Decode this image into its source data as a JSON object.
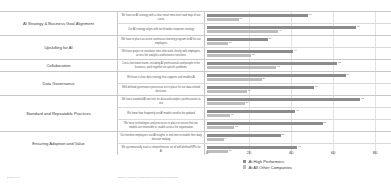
{
  "chart_data": {
    "type": "bar",
    "orientation": "horizontal",
    "title": "",
    "xlabel": "",
    "ylabel": "",
    "xlim": [
      0,
      80
    ],
    "ticks": [
      "0",
      "20",
      "40",
      "60",
      "80"
    ],
    "grid": true,
    "legend_position": "bottom",
    "series": [
      {
        "name": "At High Performers",
        "color": "#8c8c8c"
      },
      {
        "name": "At All Other Companies",
        "color": "#bdbdbd"
      }
    ],
    "categories": [
      {
        "name": "AI Strategy & Business Goal Alignment",
        "statements": [
          {
            "text": "We have an AI strategy with a clear smart time-level road map of use cases",
            "high": 48,
            "other": 15
          },
          {
            "text": "Our AI strategy aligns with our broader corporate strategy",
            "high": 71,
            "other": 34
          }
        ]
      },
      {
        "name": "Upskilling for AI",
        "statements": [
          {
            "text": "We have in place an active continuous learning program for AI for our employees",
            "high": 29,
            "other": 10
          },
          {
            "text": "We have project or translator roles who work closely with employees across the analytics and business functions",
            "high": 41,
            "other": 21
          }
        ]
      },
      {
        "name": "Collaboration",
        "statements": [
          {
            "text": "Cross-functional teams, including AI professionals and people in the business, work together on specific problems",
            "high": 62,
            "other": 33
          }
        ]
      },
      {
        "name": "Data Governance",
        "statements": [
          {
            "text": "We have a clear data strategy that supports and enables AI",
            "high": 66,
            "other": 26
          },
          {
            "text": "Well-defined governance processes are in place for our data-related decisions",
            "high": 51,
            "other": 19
          }
        ]
      },
      {
        "name": "Standard and Repeatable Practices",
        "statements": [
          {
            "text": "We have standard AI tool sets for data and analytics professionals to use",
            "high": 73,
            "other": 18
          },
          {
            "text": "We know how frequently our AI models need to be updated",
            "high": 42,
            "other": 11
          },
          {
            "text": "We have technologies and processes in place to ensure that our models are extensible or usable across the organization",
            "high": 55,
            "other": 13
          }
        ]
      },
      {
        "name": "Ensuring Adoption and Value",
        "statements": [
          {
            "text": "Our frontline employees use AI insights in real time to enable their daily decision making",
            "high": 35,
            "other": 8
          },
          {
            "text": "We systematically track a comprehensive set of well-defined KPIs for AI",
            "high": 43,
            "other": 10
          }
        ]
      }
    ]
  },
  "legend": {
    "items": [
      {
        "label": "At High Performers",
        "color": "#8c8c8c"
      },
      {
        "label": "At All Other Companies",
        "color": "#bdbdbd"
      }
    ]
  },
  "axis": {
    "ticks": [
      "0",
      "20",
      "40",
      "60",
      "80"
    ]
  },
  "footer": {
    "left": "Exhibit 4 of 4",
    "right": "Source: McKinsey Global Survey on Artificial Intelligence"
  }
}
